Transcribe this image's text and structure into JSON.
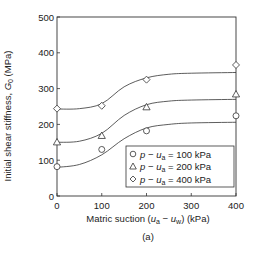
{
  "chart_data": {
    "type": "scatter",
    "title": "",
    "caption": "(a)",
    "xlabel": "Matric suction (u_a − u_w) (kPa)",
    "ylabel": "Initial shear stiffness, G_0 (MPa)",
    "xlim": [
      0,
      400
    ],
    "ylim": [
      0,
      500
    ],
    "xticks": [
      0,
      100,
      200,
      300,
      400
    ],
    "yticks": [
      0,
      100,
      200,
      300,
      400,
      500
    ],
    "grid": false,
    "legend_position": "lower right inside",
    "series": [
      {
        "name": "p − u_a = 100 kPa",
        "marker": "circle",
        "x": [
          0,
          100,
          200,
          400
        ],
        "y": [
          82,
          130,
          182,
          224
        ],
        "fit_curve": [
          [
            0,
            80
          ],
          [
            50,
            88
          ],
          [
            100,
            115
          ],
          [
            150,
            160
          ],
          [
            200,
            190
          ],
          [
            250,
            200
          ],
          [
            300,
            204
          ],
          [
            400,
            206
          ]
        ]
      },
      {
        "name": "p − u_a = 200 kPa",
        "marker": "triangle",
        "x": [
          0,
          100,
          200,
          400
        ],
        "y": [
          150,
          168,
          248,
          284
        ],
        "fit_curve": [
          [
            0,
            150
          ],
          [
            50,
            153
          ],
          [
            100,
            175
          ],
          [
            150,
            225
          ],
          [
            200,
            255
          ],
          [
            250,
            265
          ],
          [
            300,
            268
          ],
          [
            400,
            270
          ]
        ]
      },
      {
        "name": "p − u_a = 400 kPa",
        "marker": "diamond",
        "x": [
          0,
          100,
          200,
          400
        ],
        "y": [
          244,
          252,
          325,
          366
        ],
        "fit_curve": [
          [
            0,
            243
          ],
          [
            50,
            244
          ],
          [
            100,
            258
          ],
          [
            150,
            305
          ],
          [
            200,
            330
          ],
          [
            250,
            340
          ],
          [
            300,
            343
          ],
          [
            400,
            345
          ]
        ]
      }
    ]
  },
  "labels": {
    "ylabel_main": "Initial shear stiffness, ",
    "ylabel_sym": "G",
    "ylabel_sub": "0",
    "ylabel_unit": " (MPa)",
    "xlabel_main": "Matric suction (",
    "xlabel_ua": "u",
    "xlabel_ua_sub": "a",
    "xlabel_minus": " − ",
    "xlabel_uw": "u",
    "xlabel_uw_sub": "w",
    "xlabel_unit": ") (kPa)",
    "caption": "(a)",
    "legend": [
      {
        "p": "p",
        "minus": " − ",
        "u": "u",
        "sub": "a",
        "val": " = 100 kPa"
      },
      {
        "p": "p",
        "minus": " − ",
        "u": "u",
        "sub": "a",
        "val": " = 200 kPa"
      },
      {
        "p": "p",
        "minus": " − ",
        "u": "u",
        "sub": "a",
        "val": " = 400 kPa"
      }
    ]
  }
}
